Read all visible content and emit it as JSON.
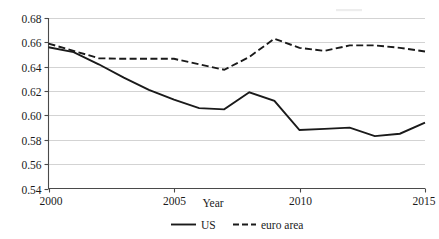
{
  "chart_data": {
    "type": "line",
    "title": "",
    "subtitle": "",
    "xlabel": "Year",
    "ylabel": "",
    "xlim": [
      2000,
      2015
    ],
    "ylim": [
      0.54,
      0.68
    ],
    "grid": true,
    "grid_axis": "y",
    "legend_position": "bottom-center",
    "x": [
      2000,
      2001,
      2002,
      2003,
      2004,
      2005,
      2006,
      2007,
      2008,
      2009,
      2010,
      2011,
      2012,
      2013,
      2014,
      2015
    ],
    "xticks": [
      "2000",
      "2005",
      "2010",
      "2015"
    ],
    "xtick_values": [
      2000,
      2005,
      2010,
      2015
    ],
    "yticks": [
      "0.54",
      "0.56",
      "0.58",
      "0.60",
      "0.62",
      "0.64",
      "0.66",
      "0.68"
    ],
    "ytick_values": [
      0.54,
      0.56,
      0.58,
      0.6,
      0.62,
      0.64,
      0.66,
      0.68
    ],
    "series": [
      {
        "name": "US",
        "style": "solid",
        "color": "#1a1a1a",
        "values": [
          0.656,
          0.652,
          0.642,
          0.631,
          0.621,
          0.613,
          0.606,
          0.605,
          0.619,
          0.612,
          0.588,
          0.589,
          0.59,
          0.583,
          0.585,
          0.594
        ]
      },
      {
        "name": "euro area",
        "style": "dashed",
        "color": "#1a1a1a",
        "values": [
          0.659,
          0.653,
          0.647,
          0.6465,
          0.6465,
          0.6465,
          0.642,
          0.6375,
          0.648,
          0.663,
          0.6555,
          0.653,
          0.6575,
          0.6575,
          0.6555,
          0.6525
        ]
      }
    ],
    "legend": [
      {
        "label": "US",
        "style": "solid"
      },
      {
        "label": "euro area",
        "style": "dashed"
      }
    ]
  },
  "axis": {
    "x_title": "Year"
  }
}
